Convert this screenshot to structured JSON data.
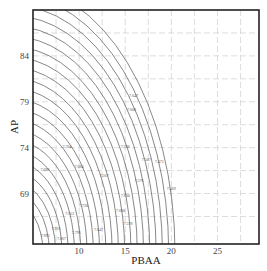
{
  "chart_data": {
    "type": "contour",
    "title": "",
    "xlabel": "PBAA",
    "ylabel": "AP",
    "xlim": [
      5,
      29.5
    ],
    "ylim": [
      63.5,
      89
    ],
    "xticks": [
      10,
      15,
      20,
      25
    ],
    "yticks": [
      69,
      74,
      79,
      84
    ],
    "grid": true,
    "grid_style": "dashed",
    "contour_center": {
      "x": 5,
      "y": 63.5
    },
    "contour_levels": 22,
    "contour_labels": [
      {
        "text": "7.647",
        "x": 15.4,
        "y": 79.5
      },
      {
        "text": "7.608",
        "x": 15.2,
        "y": 78.0
      },
      {
        "text": "7.704",
        "x": 8.2,
        "y": 74.0
      },
      {
        "text": "7.720",
        "x": 14.5,
        "y": 74.0
      },
      {
        "text": "7.507",
        "x": 16.8,
        "y": 72.5
      },
      {
        "text": "7.471",
        "x": 18.2,
        "y": 72.3
      },
      {
        "text": "7.696",
        "x": 5.8,
        "y": 71.5
      },
      {
        "text": "7.684",
        "x": 9.5,
        "y": 71.8
      },
      {
        "text": "7.567",
        "x": 12.2,
        "y": 70.8
      },
      {
        "text": "7.576",
        "x": 16.0,
        "y": 70.3
      },
      {
        "text": "7.469",
        "x": 19.5,
        "y": 69.4
      },
      {
        "text": "7.630",
        "x": 14.5,
        "y": 68.6
      },
      {
        "text": "7.720",
        "x": 10.0,
        "y": 67.5
      },
      {
        "text": "7.680",
        "x": 14.0,
        "y": 67.0
      },
      {
        "text": "7.652",
        "x": 8.5,
        "y": 66.7
      },
      {
        "text": "7.578",
        "x": 14.8,
        "y": 65.6
      },
      {
        "text": "7.916",
        "x": 7.0,
        "y": 65.0
      },
      {
        "text": "7.796",
        "x": 9.2,
        "y": 64.6
      },
      {
        "text": "7.647",
        "x": 11.6,
        "y": 64.9
      },
      {
        "text": "7.993",
        "x": 5.8,
        "y": 64.3
      },
      {
        "text": "7.867",
        "x": 7.6,
        "y": 63.9
      }
    ]
  }
}
